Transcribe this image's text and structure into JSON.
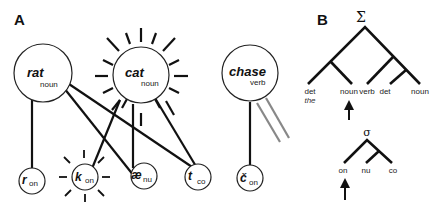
{
  "panel_a": {
    "label": "A",
    "word_nodes": [
      {
        "word": "rat",
        "pos": "noun",
        "active": false
      },
      {
        "word": "cat",
        "pos": "noun",
        "active": true
      },
      {
        "word": "chase",
        "pos": "verb",
        "active": false
      }
    ],
    "phoneme_nodes": [
      {
        "phoneme": "r",
        "role": "on",
        "active": false
      },
      {
        "phoneme": "k",
        "role": "on",
        "active": true
      },
      {
        "phoneme": "æ",
        "role": "nu",
        "active": false
      },
      {
        "phoneme": "t",
        "role": "co",
        "active": false
      },
      {
        "phoneme": "č",
        "role": "on",
        "active": false
      }
    ]
  },
  "panel_b": {
    "label": "B",
    "syntax_tree": {
      "root": "Σ",
      "leaves": [
        "det",
        "noun",
        "verb",
        "det",
        "noun"
      ],
      "leaf_example": "the",
      "arrow_under": "noun"
    },
    "syllable_tree": {
      "root": "σ",
      "leaves": [
        "on",
        "nu",
        "co"
      ],
      "arrow_under": "on"
    }
  }
}
